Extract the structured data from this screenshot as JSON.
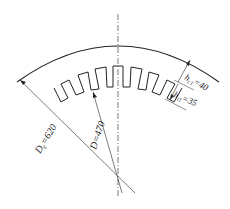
{
  "diagram": {
    "labels": {
      "outer_diameter": {
        "symbol": "D",
        "sub": "c",
        "value": "=620"
      },
      "inner_diameter": {
        "symbol": "D",
        "sub": "",
        "value": "=470"
      },
      "yoke_height": {
        "symbol": "h",
        "sub": "c1",
        "value": "=40"
      },
      "tooth_height": {
        "symbol": "h",
        "sub": "t1",
        "value": "=35"
      }
    },
    "colors": {
      "line": "#222222",
      "background": "#ffffff"
    }
  }
}
